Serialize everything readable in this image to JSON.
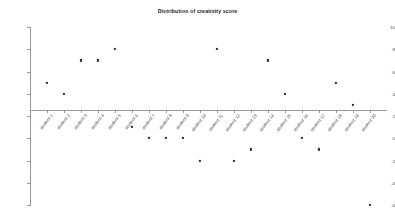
{
  "chart": {
    "title": "Distribution of creativity score"
  },
  "chart_data": {
    "type": "scatter",
    "title": "Distribution of creativity score",
    "xlabel": "",
    "ylabel": "",
    "grid": false,
    "legend": "none",
    "ylim": [
      -6,
      10
    ],
    "yticks": [
      10,
      8,
      6,
      4,
      2,
      0,
      -2,
      -4,
      -6
    ],
    "ytick_labels": [
      "10",
      "8",
      "6",
      "4",
      "2",
      "0",
      "-2",
      "-4",
      "-6"
    ],
    "categories": [
      "student 1",
      "student 2",
      "student 3",
      "student 4",
      "student 5",
      "student 6",
      "student 7",
      "student 8",
      "student 9",
      "student 10",
      "student 11",
      "student 12",
      "student 13",
      "student 14",
      "student 15",
      "student 16",
      "student 17",
      "student 18",
      "student 19",
      "student 20"
    ],
    "values": [
      5,
      4,
      7,
      7,
      8,
      1,
      0,
      0,
      0,
      -2,
      8,
      -2,
      -1,
      7,
      4,
      0,
      -1,
      5,
      3,
      -6
    ],
    "marker": "dot",
    "marker_color": "#2b2b2b",
    "axis_color": "#9a9a9a",
    "background": "#ffffff"
  }
}
